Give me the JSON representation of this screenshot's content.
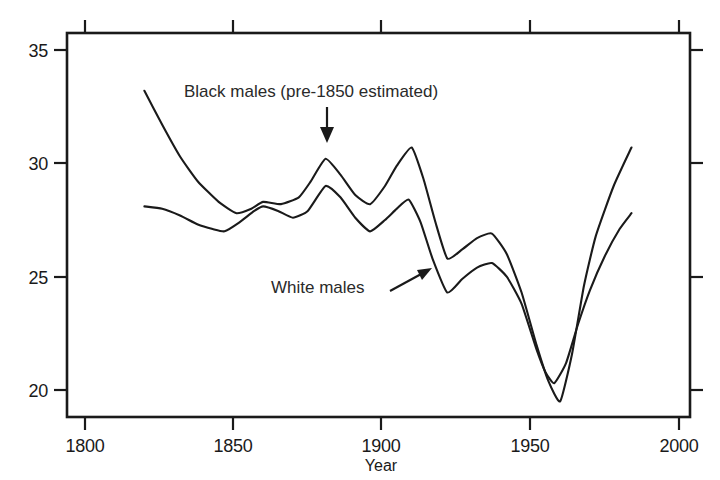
{
  "chart_data": {
    "type": "line",
    "title": "",
    "xlabel": "Year",
    "ylabel": "",
    "xlim": [
      1800,
      2000
    ],
    "ylim": [
      20,
      35
    ],
    "xticks": [
      1800,
      1850,
      1900,
      1950,
      2000
    ],
    "xtick_labels": [
      "1800",
      "1850",
      "1900",
      "1950",
      "2000"
    ],
    "yticks": [
      20,
      25,
      30,
      35
    ],
    "ytick_labels": [
      "20",
      "25",
      "30",
      "35"
    ],
    "grid": false,
    "legend": "none",
    "frame": "box with outward ticks on all four sides",
    "series": [
      {
        "name": "Black males (pre-1850 estimated)",
        "x": [
          1820,
          1826,
          1832,
          1838,
          1845,
          1851,
          1856,
          1860,
          1866,
          1872,
          1876,
          1881,
          1886,
          1891,
          1896,
          1901,
          1905,
          1910,
          1914,
          1918,
          1922,
          1927,
          1932,
          1937,
          1942,
          1947,
          1952,
          1956,
          1960,
          1964,
          1968,
          1972,
          1978,
          1984
        ],
        "y": [
          33.2,
          31.7,
          30.3,
          29.2,
          28.3,
          27.8,
          28.0,
          28.3,
          28.2,
          28.5,
          29.2,
          30.2,
          29.5,
          28.6,
          28.2,
          29.0,
          29.9,
          30.7,
          29.3,
          27.4,
          25.8,
          26.2,
          26.7,
          26.9,
          26.0,
          24.3,
          22.0,
          20.4,
          19.5,
          21.6,
          24.6,
          26.8,
          29.0,
          30.7
        ]
      },
      {
        "name": "White males",
        "x": [
          1820,
          1826,
          1832,
          1838,
          1843,
          1847,
          1852,
          1857,
          1860,
          1865,
          1870,
          1875,
          1881,
          1886,
          1891,
          1896,
          1901,
          1905,
          1909,
          1913,
          1917,
          1922,
          1927,
          1932,
          1937,
          1942,
          1947,
          1952,
          1955,
          1958,
          1962,
          1966,
          1970,
          1975,
          1980,
          1984
        ],
        "y": [
          28.1,
          28.0,
          27.7,
          27.3,
          27.1,
          27.0,
          27.4,
          27.9,
          28.1,
          27.9,
          27.6,
          27.9,
          29.0,
          28.5,
          27.6,
          27.0,
          27.5,
          28.0,
          28.4,
          27.4,
          25.8,
          24.3,
          24.9,
          25.4,
          25.6,
          25.0,
          23.8,
          21.8,
          20.8,
          20.3,
          21.2,
          22.9,
          24.4,
          25.9,
          27.1,
          27.8
        ]
      }
    ],
    "annotations": [
      {
        "id": "black-males-annotation",
        "text": "Black males (pre-1850 estimated)",
        "pointer": "down-arrow",
        "points_at_year": 1881
      },
      {
        "id": "white-males-annotation",
        "text": "White males",
        "pointer": "up-right-arrow",
        "points_at_year": 1922
      }
    ],
    "colors": {
      "line": "#1a1a1a",
      "axis": "#1a1a1a",
      "background": "#ffffff",
      "annotation_text": "#2a2a2a"
    }
  }
}
